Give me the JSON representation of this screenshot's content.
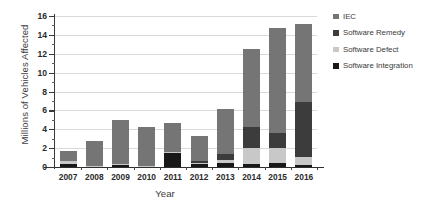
{
  "chart_data": {
    "type": "bar",
    "stacked": true,
    "title": "",
    "xlabel": "Year",
    "ylabel": "Millions of Vehicles Affected",
    "categories": [
      "2007",
      "2008",
      "2009",
      "2010",
      "2011",
      "2012",
      "2013",
      "2014",
      "2015",
      "2016"
    ],
    "ylim": [
      0,
      16
    ],
    "yticks": [
      0,
      2,
      4,
      6,
      8,
      10,
      12,
      14,
      16
    ],
    "ytick_labels": [
      "0",
      "2",
      "4",
      "6",
      "8",
      "10",
      "12",
      "14",
      "16"
    ],
    "grid": true,
    "legend_position": "right",
    "series": [
      {
        "name": "Software Integration",
        "color": "#181818",
        "values": [
          0.3,
          0.1,
          0.2,
          0.1,
          1.5,
          0.35,
          0.4,
          0.35,
          0.45,
          0.25
        ]
      },
      {
        "name": "Software Defect",
        "color": "#c8c8c8",
        "values": [
          0.35,
          0.05,
          0.1,
          0.05,
          0.1,
          0.1,
          0.35,
          1.65,
          1.6,
          0.8
        ]
      },
      {
        "name": "Software Remedy",
        "color": "#3c3c3c",
        "values": [
          0.0,
          0.0,
          0.0,
          0.0,
          0.0,
          0.2,
          0.6,
          2.2,
          1.6,
          5.8
        ]
      },
      {
        "name": "IEC",
        "color": "#757575",
        "values": [
          1.05,
          2.65,
          4.7,
          4.05,
          3.1,
          2.65,
          4.85,
          8.3,
          11.05,
          8.35
        ]
      }
    ],
    "totals": [
      1.7,
      2.8,
      5.0,
      4.2,
      4.7,
      3.3,
      6.2,
      12.5,
      14.7,
      15.2
    ]
  },
  "legend": {
    "items": [
      {
        "label": "IEC",
        "color": "#757575"
      },
      {
        "label": "Software Remedy",
        "color": "#3c3c3c"
      },
      {
        "label": "Software Defect",
        "color": "#c8c8c8"
      },
      {
        "label": "Software Integration",
        "color": "#181818"
      }
    ]
  }
}
